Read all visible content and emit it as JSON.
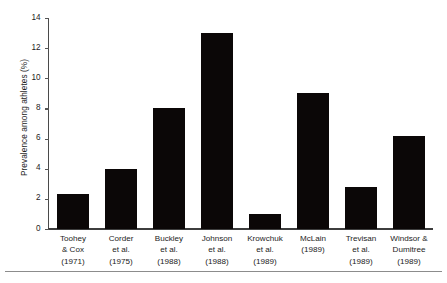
{
  "chart_data": {
    "type": "bar",
    "title": "",
    "xlabel": "",
    "ylabel": "Prevalence among athletes (%)",
    "ylim": [
      0,
      14
    ],
    "yticks": [
      0,
      2,
      4,
      6,
      8,
      10,
      12,
      14
    ],
    "grid": false,
    "legend": null,
    "bar_color": "#0b0707",
    "categories": [
      "Toohey & Cox (1971)",
      "Corder et al. (1975)",
      "Buckley et al. (1988)",
      "Johnson et al. (1988)",
      "Krowchuk et al. (1989)",
      "McLain (1989)",
      "Trevisan et al. (1989)",
      "Windsor & Dumitree (1989)"
    ],
    "category_lines": [
      [
        "Toohey",
        "& Cox",
        "(1971)"
      ],
      [
        "Corder",
        "et al.",
        "(1975)"
      ],
      [
        "Buckley",
        "et al.",
        "(1988)"
      ],
      [
        "Johnson",
        "et al.",
        "(1988)"
      ],
      [
        "Krowchuk",
        "et al.",
        "(1989)"
      ],
      [
        "McLain",
        "(1989)"
      ],
      [
        "Trevisan",
        "et al.",
        "(1989)"
      ],
      [
        "Windsor &",
        "Dumitree",
        "(1989)"
      ]
    ],
    "values": [
      2.3,
      4.0,
      8.0,
      13.0,
      1.0,
      9.0,
      2.8,
      6.2
    ]
  }
}
